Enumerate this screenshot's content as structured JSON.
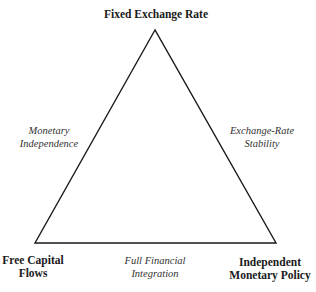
{
  "diagram": {
    "vertices": {
      "top": {
        "label": "Fixed Exchange Rate"
      },
      "bottom_left": {
        "line1": "Free Capital",
        "line2": "Flows"
      },
      "bottom_right": {
        "line1": "Independent",
        "line2": "Monetary Policy"
      }
    },
    "edges": {
      "left": {
        "line1": "Monetary",
        "line2": "Independence"
      },
      "right": {
        "line1": "Exchange-Rate",
        "line2": "Stability"
      },
      "bottom": {
        "line1": "Full Financial",
        "line2": "Integration"
      }
    },
    "colors": {
      "line": "#1a1a1a",
      "background": "#ffffff"
    }
  }
}
